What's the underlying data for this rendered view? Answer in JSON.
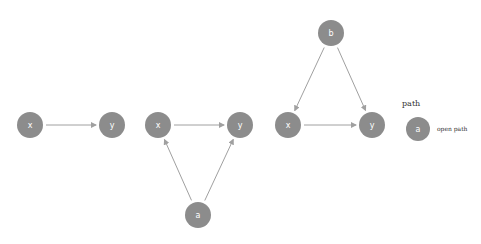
{
  "diagrams": [
    {
      "name": "chain",
      "nodes": [
        {
          "id": "x1",
          "label": "x",
          "cx": 30,
          "cy": 125
        },
        {
          "id": "y1",
          "label": "y",
          "cx": 112,
          "cy": 125
        }
      ],
      "edges": [
        {
          "from": "x1",
          "to": "y1"
        }
      ]
    },
    {
      "name": "confounded-by-a",
      "nodes": [
        {
          "id": "x2",
          "label": "x",
          "cx": 158,
          "cy": 125
        },
        {
          "id": "y2",
          "label": "y",
          "cx": 240,
          "cy": 125
        },
        {
          "id": "a",
          "label": "a",
          "cx": 198,
          "cy": 215
        }
      ],
      "edges": [
        {
          "from": "x2",
          "to": "y2"
        },
        {
          "from": "a",
          "to": "x2"
        },
        {
          "from": "a",
          "to": "y2"
        }
      ]
    },
    {
      "name": "confounded-by-b",
      "nodes": [
        {
          "id": "b",
          "label": "b",
          "cx": 331,
          "cy": 33
        },
        {
          "id": "x3",
          "label": "x",
          "cx": 288,
          "cy": 125
        },
        {
          "id": "y3",
          "label": "y",
          "cx": 372,
          "cy": 125
        }
      ],
      "edges": [
        {
          "from": "x3",
          "to": "y3"
        },
        {
          "from": "b",
          "to": "x3"
        },
        {
          "from": "b",
          "to": "y3"
        }
      ]
    }
  ],
  "legend": {
    "title": "path",
    "node_label": "a",
    "entry_label": "open path"
  },
  "colors": {
    "node": "#8c8c8c",
    "edge": "#a0a0a0",
    "node_text": "#ffffff"
  }
}
